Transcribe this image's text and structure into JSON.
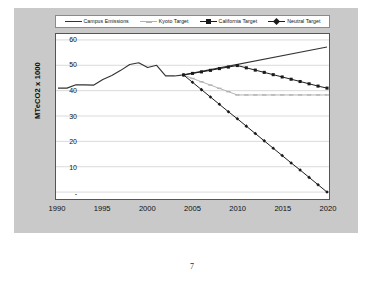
{
  "page": {
    "number": "7"
  },
  "chart": {
    "legend": {
      "position": "top",
      "items": [
        {
          "label": "Campus Emissions",
          "color": "#333333",
          "marker": "none"
        },
        {
          "label": "Kyoto Target",
          "color": "#b3b3b3",
          "marker": "dash"
        },
        {
          "label": "California Target",
          "color": "#1a1a1a",
          "marker": "square"
        },
        {
          "label": "Neutral Target",
          "color": "#1a1a1a",
          "marker": "diamond"
        }
      ]
    },
    "axes": {
      "y_title": "MTeCO2 x 1000",
      "y_ticks": [
        "60",
        "50",
        "40",
        "30",
        "20",
        "10",
        "-"
      ],
      "x_ticks": [
        "1990",
        "1995",
        "2000",
        "2005",
        "2010",
        "2015",
        "2020"
      ]
    }
  },
  "chart_data": {
    "type": "line",
    "title": "",
    "xlabel": "",
    "ylabel": "MTeCO2 x 1000",
    "xlim": [
      1990,
      2020
    ],
    "ylim": [
      0,
      60
    ],
    "ytick_values": [
      0,
      10,
      20,
      30,
      40,
      50,
      60
    ],
    "ytick_labels": [
      "-",
      "10",
      "20",
      "30",
      "40",
      "50",
      "60"
    ],
    "xtick_values": [
      1990,
      1995,
      2000,
      2005,
      2010,
      2015,
      2020
    ],
    "xtick_labels": [
      "1990",
      "1995",
      "2000",
      "2005",
      "2010",
      "2015",
      "2020"
    ],
    "grid": "horizontal",
    "legend_position": "top",
    "series": [
      {
        "name": "Campus Emissions",
        "color": "#333333",
        "marker": "none",
        "x": [
          1990,
          1991,
          1992,
          1993,
          1994,
          1995,
          1996,
          1997,
          1998,
          1999,
          2000,
          2001,
          2002,
          2003,
          2004,
          2020
        ],
        "values": [
          41.0,
          41.0,
          42.3,
          42.3,
          42.2,
          44.4,
          46.0,
          48.0,
          50.3,
          51.0,
          49.1,
          50.0,
          45.8,
          45.8,
          46.2,
          57.2
        ]
      },
      {
        "name": "Kyoto Target",
        "color": "#b3b3b3",
        "marker": "dash",
        "x": [
          2004,
          2005,
          2006,
          2007,
          2008,
          2009,
          2010,
          2011,
          2012,
          2013,
          2014,
          2015,
          2016,
          2017,
          2018,
          2019,
          2020
        ],
        "values": [
          46.2,
          44.8,
          43.5,
          42.2,
          40.9,
          39.6,
          38.3,
          38.3,
          38.3,
          38.3,
          38.3,
          38.3,
          38.3,
          38.3,
          38.3,
          38.3,
          38.3
        ]
      },
      {
        "name": "California Target",
        "color": "#1a1a1a",
        "marker": "square",
        "x": [
          2004,
          2005,
          2006,
          2007,
          2008,
          2009,
          2010,
          2011,
          2012,
          2013,
          2014,
          2015,
          2016,
          2017,
          2018,
          2019,
          2020
        ],
        "values": [
          46.2,
          46.8,
          47.4,
          48.0,
          48.7,
          49.3,
          49.9,
          49.0,
          48.1,
          47.2,
          46.3,
          45.4,
          44.5,
          43.6,
          42.7,
          41.8,
          41.0
        ]
      },
      {
        "name": "Neutral Target",
        "color": "#1a1a1a",
        "marker": "diamond",
        "x": [
          2004,
          2005,
          2006,
          2007,
          2008,
          2009,
          2010,
          2011,
          2012,
          2013,
          2014,
          2015,
          2016,
          2017,
          2018,
          2019,
          2020
        ],
        "values": [
          46.2,
          43.3,
          40.4,
          37.5,
          34.6,
          31.7,
          28.9,
          26.0,
          23.1,
          20.2,
          17.3,
          14.4,
          11.5,
          8.7,
          5.8,
          2.9,
          0.0
        ]
      }
    ]
  }
}
